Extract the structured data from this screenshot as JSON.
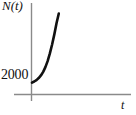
{
  "figure": {
    "background_color": "#ffffff",
    "axis_color": "#8a8a8a",
    "curve_color": "#111111"
  },
  "labels": {
    "y_axis": "N(t)",
    "x_axis": "t",
    "y_tick_2000": "2000"
  },
  "chart_data": {
    "type": "line",
    "title": "",
    "subtitle": "",
    "xlabel": "t",
    "ylabel": "N(t)",
    "grid": false,
    "legend": null,
    "annotations": [],
    "x_tick_labels": [],
    "y_tick_labels": [
      "2000"
    ],
    "xlim": [
      0,
      5
    ],
    "ylim": [
      0,
      14000
    ],
    "series": [
      {
        "name": "N(t)",
        "x": [
          0.0,
          0.25,
          0.5,
          0.75,
          1.0,
          1.25,
          1.5,
          1.75,
          2.0,
          2.25,
          2.5,
          2.75,
          3.0
        ],
        "y": [
          2000,
          2180,
          2420,
          2760,
          3200,
          3800,
          4600,
          5600,
          6900,
          8400,
          10100,
          12000,
          13600
        ]
      }
    ]
  }
}
